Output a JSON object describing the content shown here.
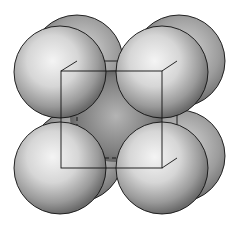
{
  "figure": {
    "structure": "bcc",
    "cube": {
      "front": {
        "x1": 61,
        "y1": 71,
        "x2": 162,
        "y2": 168
      },
      "back": {
        "x1": 77,
        "y1": 61,
        "x2": 177,
        "y2": 158
      }
    },
    "sphere_radius": 46,
    "back_spheres": [
      {
        "cx": 78,
        "cy": 61
      },
      {
        "cx": 178,
        "cy": 61
      },
      {
        "cx": 78,
        "cy": 157
      },
      {
        "cx": 178,
        "cy": 157
      }
    ],
    "center_sphere": {
      "cx": 116,
      "cy": 116,
      "r": 46
    },
    "front_spheres": [
      {
        "cx": 60,
        "cy": 72
      },
      {
        "cx": 162,
        "cy": 72
      },
      {
        "cx": 60,
        "cy": 168
      },
      {
        "cx": 162,
        "cy": 168
      }
    ],
    "colors": {
      "highlight": "#f2f2f2",
      "shade": "#6e6e6e",
      "outline": "#111111"
    }
  }
}
